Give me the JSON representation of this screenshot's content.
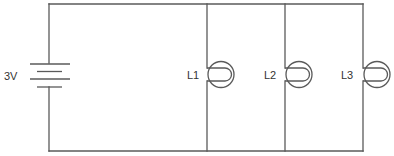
{
  "diagram": {
    "type": "electric-circuit",
    "battery": {
      "label": "3V",
      "cells": 2
    },
    "lamps": [
      {
        "label": "L1"
      },
      {
        "label": "L2"
      },
      {
        "label": "L3"
      }
    ],
    "colors": {
      "wire": "#5a5a5a",
      "text": "#333333",
      "background": "#ffffff"
    }
  }
}
